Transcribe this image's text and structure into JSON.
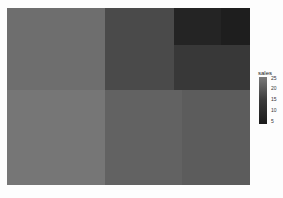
{
  "chart_data": {
    "type": "treemap",
    "title": "",
    "legend": {
      "title": "sales",
      "ticks": [
        "25",
        "20",
        "15",
        "10",
        "5"
      ],
      "position": "right"
    },
    "tiles": [
      {
        "x": 0,
        "y": 0,
        "w": 98,
        "h": 82,
        "value": 20,
        "color": "#6e6e6e"
      },
      {
        "x": 98,
        "y": 0,
        "w": 69,
        "h": 82,
        "value": 13,
        "color": "#4a4a4a"
      },
      {
        "x": 167,
        "y": 0,
        "w": 47,
        "h": 37,
        "value": 5,
        "color": "#242424"
      },
      {
        "x": 214,
        "y": 0,
        "w": 29,
        "h": 37,
        "value": 4,
        "color": "#1e1e1e"
      },
      {
        "x": 167,
        "y": 37,
        "w": 76,
        "h": 45,
        "value": 9,
        "color": "#383838"
      },
      {
        "x": 0,
        "y": 82,
        "w": 98,
        "h": 95,
        "value": 23,
        "color": "#767676"
      },
      {
        "x": 98,
        "y": 82,
        "w": 77,
        "h": 95,
        "value": 18,
        "color": "#626262"
      },
      {
        "x": 175,
        "y": 82,
        "w": 68,
        "h": 95,
        "value": 17,
        "color": "#5c5c5c"
      }
    ]
  }
}
